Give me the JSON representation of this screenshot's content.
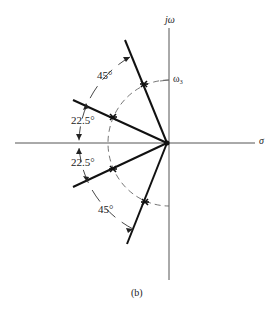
{
  "diagram": {
    "type": "s-plane pole plot",
    "axes": {
      "imag_label": "jω",
      "real_label": "σ",
      "radius_label": "ω₃"
    },
    "angles": {
      "top_45": "45°",
      "upper_22_5": "22.5°",
      "lower_22_5": "22.5°",
      "bottom_45": "45°"
    },
    "caption": "(b)",
    "poles": [
      {
        "angle_deg": 112.5
      },
      {
        "angle_deg": 157.5
      },
      {
        "angle_deg": 202.5
      },
      {
        "angle_deg": 247.5
      }
    ],
    "colors": {
      "line": "#111111",
      "axis": "#555555",
      "dashed": "#666666"
    }
  }
}
